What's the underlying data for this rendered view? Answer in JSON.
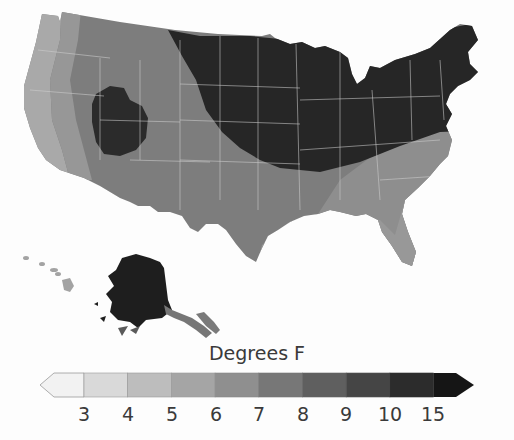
{
  "map": {
    "region": "United States",
    "insets": [
      "Alaska",
      "Hawaii"
    ],
    "state_border_color": "#cfcfcf",
    "zones": [
      {
        "name": "pacific-coast-strip",
        "bin": "4-5",
        "color": "#a9a9a9"
      },
      {
        "name": "pacific-inland-strip",
        "bin": "5-6",
        "color": "#979797"
      },
      {
        "name": "west-and-south",
        "bin": "7-8",
        "color": "#7d7d7d"
      },
      {
        "name": "southeast",
        "bin": "6-7",
        "color": "#8e8e8e"
      },
      {
        "name": "gulf-coast-florida",
        "bin": "5-6",
        "color": "#989898"
      },
      {
        "name": "colorado-plateau",
        "bin": "10-15",
        "color": "#2b2b2b"
      },
      {
        "name": "north-central-and-northeast",
        "bin": "10-15",
        "color": "#262626"
      },
      {
        "name": "alaska-main",
        "bin": ">15",
        "color": "#1e1e1e"
      },
      {
        "name": "alaska-panhandle",
        "bin": "7-8",
        "color": "#767676"
      },
      {
        "name": "hawaii",
        "bin": "4-5",
        "color": "#a3a3a3"
      }
    ]
  },
  "legend": {
    "title": "Degrees F",
    "ticks": [
      "3",
      "4",
      "5",
      "6",
      "7",
      "8",
      "9",
      "10",
      "15"
    ],
    "bins": [
      {
        "label": "<3",
        "color": "#f2f2f2"
      },
      {
        "label": "3-4",
        "color": "#d9d9d9"
      },
      {
        "label": "4-5",
        "color": "#bdbdbd"
      },
      {
        "label": "5-6",
        "color": "#a5a5a5"
      },
      {
        "label": "6-7",
        "color": "#8f8f8f"
      },
      {
        "label": "7-8",
        "color": "#777777"
      },
      {
        "label": "8-9",
        "color": "#5f5f5f"
      },
      {
        "label": "9-10",
        "color": "#454545"
      },
      {
        "label": "10-15",
        "color": "#2c2c2c"
      },
      {
        "label": ">15",
        "color": "#151515"
      }
    ],
    "low_arrow": "open-ended below 3",
    "high_arrow": "open-ended above 15"
  }
}
